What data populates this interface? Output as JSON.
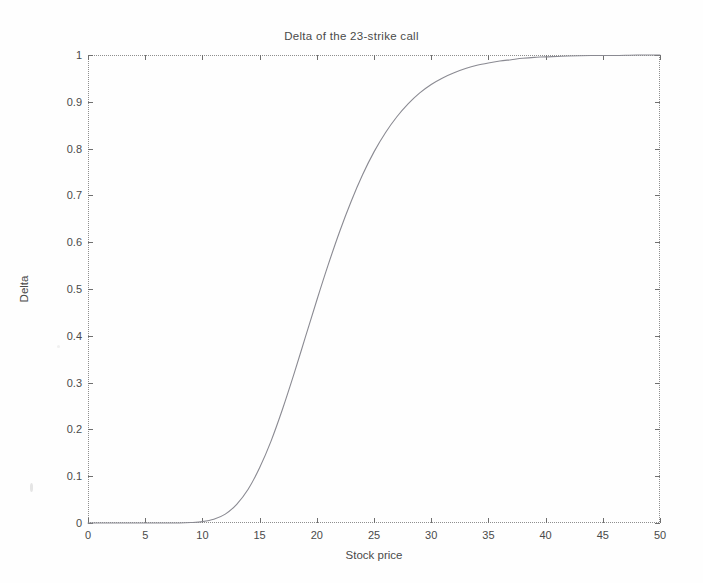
{
  "chart_data": {
    "type": "line",
    "title": "Delta of the 23-strike call",
    "xlabel": "Stock price",
    "ylabel": "Delta",
    "xlim": [
      0,
      50
    ],
    "ylim": [
      0,
      1
    ],
    "grid": false,
    "legend": null,
    "xticks": [
      "0",
      "5",
      "10",
      "15",
      "20",
      "25",
      "30",
      "35",
      "40",
      "45",
      "50"
    ],
    "yticks": [
      "0",
      "0.1",
      "0.2",
      "0.3",
      "0.4",
      "0.5",
      "0.6",
      "0.7",
      "0.8",
      "0.9",
      "1"
    ],
    "series": [
      {
        "name": "Delta",
        "color": "#8a8a92",
        "x": [
          0,
          1,
          2,
          3,
          4,
          5,
          6,
          7,
          8,
          9,
          10,
          11,
          12,
          13,
          14,
          15,
          16,
          17,
          18,
          19,
          20,
          21,
          22,
          23,
          24,
          25,
          26,
          27,
          28,
          29,
          30,
          31,
          32,
          33,
          34,
          35,
          36,
          37,
          38,
          39,
          40,
          42,
          44,
          46,
          48,
          50
        ],
        "values": [
          0.0,
          0.0,
          0.0,
          0.0,
          0.0,
          0.0,
          0.0,
          0.0,
          0.0,
          0.001,
          0.003,
          0.008,
          0.019,
          0.04,
          0.072,
          0.118,
          0.175,
          0.243,
          0.318,
          0.397,
          0.476,
          0.552,
          0.623,
          0.687,
          0.744,
          0.793,
          0.834,
          0.868,
          0.896,
          0.919,
          0.937,
          0.951,
          0.962,
          0.971,
          0.978,
          0.983,
          0.987,
          0.99,
          0.993,
          0.995,
          0.996,
          0.998,
          0.999,
          0.999,
          1.0,
          1.0
        ]
      }
    ]
  },
  "figure": {
    "background_color": "#ffffff",
    "axis_color": "#8e8e8e",
    "text_color": "#4a4a4a"
  }
}
